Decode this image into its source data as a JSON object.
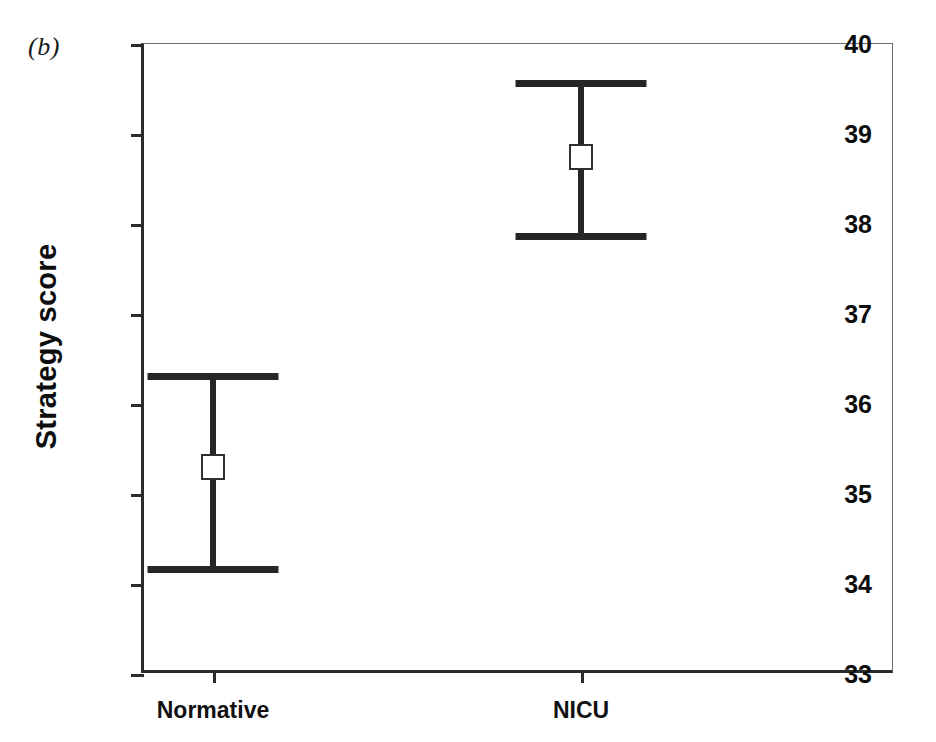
{
  "figure": {
    "panel_label": "(b)",
    "background_color": "#ffffff",
    "ink_color": "#262626"
  },
  "axes": {
    "ylabel": "Strategy score",
    "xlabel": "",
    "yticks": [
      "40",
      "39",
      "38",
      "37",
      "36",
      "35",
      "34",
      "33"
    ],
    "xticks": [
      "Normative",
      "NICU"
    ]
  },
  "chart_data": {
    "type": "scatter",
    "title": "",
    "subtitle": "",
    "panel": "(b)",
    "xlabel": "",
    "ylabel": "Strategy score",
    "categories": [
      "Normative",
      "NICU"
    ],
    "values": [
      35.3,
      38.75
    ],
    "error_low": [
      34.2,
      37.9
    ],
    "error_high": [
      36.35,
      39.6
    ],
    "error_bar_style": "capped-interval",
    "marker": "open-square",
    "ylim": [
      33,
      40
    ],
    "ytick_values": [
      33,
      34,
      35,
      36,
      37,
      38,
      39,
      40
    ],
    "grid": false,
    "legend": false,
    "series": [
      {
        "name": "Strategy score",
        "points": [
          {
            "category": "Normative",
            "mean": 35.3,
            "lower": 34.2,
            "upper": 36.35
          },
          {
            "category": "NICU",
            "mean": 38.75,
            "lower": 37.9,
            "upper": 39.6
          }
        ]
      }
    ]
  }
}
